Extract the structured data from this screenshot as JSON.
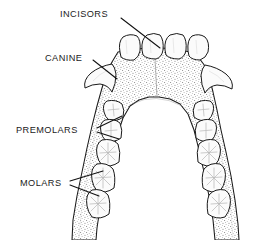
{
  "figure": {
    "background_color": "#ffffff",
    "ink_color": "#1a1a1a",
    "stipple_color": "#6e6e6e",
    "tooth_fill": "#fbfbfb",
    "width": 268,
    "height": 240
  },
  "labels": [
    {
      "id": "incisors",
      "text": "INCISORS",
      "x": 60,
      "y": 15,
      "leaders": 1,
      "points_to": "central and lateral incisors"
    },
    {
      "id": "canine",
      "text": "CANINE",
      "x": 45,
      "y": 59,
      "leaders": 1,
      "points_to": "left canine cusp"
    },
    {
      "id": "premolars",
      "text": "PREMOLARS",
      "x": 16,
      "y": 131,
      "leaders": 2,
      "points_to": "first and second premolars"
    },
    {
      "id": "molars",
      "text": "MOLARS",
      "x": 20,
      "y": 184,
      "leaders": 2,
      "points_to": "first, second and third molars"
    }
  ],
  "dentition": {
    "incisor_count": 4,
    "canine_count": 2,
    "premolar_count_per_side": 2,
    "molar_count_per_side": 3,
    "total_teeth_shown": 16,
    "arch": "mandibular"
  }
}
